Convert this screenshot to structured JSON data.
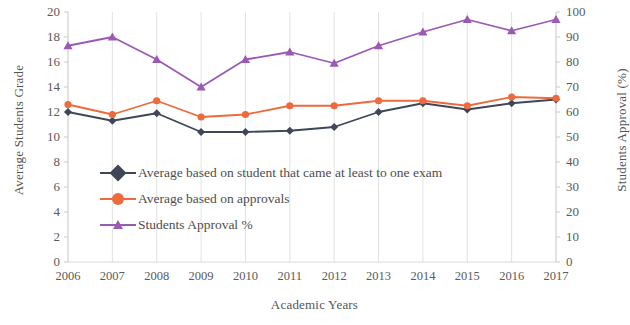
{
  "chart_data": {
    "type": "line",
    "title": "",
    "xlabel": "Academic Years",
    "ylabel": "Average Students Grade",
    "y2label": "Students Approval (%)",
    "categories": [
      "2006",
      "2007",
      "2008",
      "2009",
      "2010",
      "2011",
      "2012",
      "2013",
      "2014",
      "2015",
      "2016",
      "2017"
    ],
    "ylim": [
      0,
      20
    ],
    "y2lim": [
      0,
      100
    ],
    "yticks": [
      "0",
      "2",
      "4",
      "6",
      "8",
      "10",
      "12",
      "14",
      "16",
      "18",
      "20"
    ],
    "y2ticks": [
      "0",
      "10",
      "20",
      "30",
      "40",
      "50",
      "60",
      "70",
      "80",
      "90",
      "100"
    ],
    "grid": true,
    "legend_position": "inside-left",
    "series": [
      {
        "name": "Average based on student that came at least to one exam",
        "color": "#3f4658",
        "marker": "diamond",
        "axis": "left",
        "values": [
          12.0,
          11.3,
          11.9,
          10.4,
          10.4,
          10.5,
          10.8,
          12.0,
          12.7,
          12.2,
          12.7,
          13.0
        ]
      },
      {
        "name": "Average based on approvals",
        "color": "#ed6a3c",
        "marker": "circle",
        "axis": "left",
        "values": [
          12.6,
          11.8,
          12.9,
          11.6,
          11.8,
          12.5,
          12.5,
          12.9,
          12.9,
          12.5,
          13.2,
          13.1
        ]
      },
      {
        "name": "Students Approval %",
        "color": "#9b59b6",
        "marker": "triangle",
        "axis": "right",
        "values": [
          86.5,
          90.0,
          81.0,
          70.0,
          81.0,
          84.0,
          79.5,
          86.5,
          92.0,
          97.0,
          92.5,
          97.0
        ]
      }
    ]
  },
  "axes": {
    "left_title": "Average Students Grade",
    "right_title": "Students Approval (%)",
    "bottom_title": "Academic Years"
  },
  "legend": {
    "items": [
      {
        "label": "Average based on student that came at least to one exam"
      },
      {
        "label": "Average based on approvals"
      },
      {
        "label": "Students Approval %"
      }
    ]
  }
}
